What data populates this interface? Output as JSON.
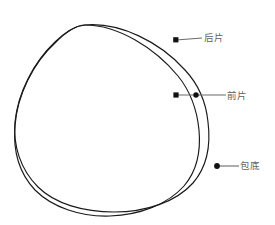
{
  "diagram": {
    "type": "technical-line-drawing",
    "canvas": {
      "width": 275,
      "height": 225,
      "background": "#ffffff"
    },
    "stroke_color": "#1a1a1a",
    "leader_color": "#6b6b6b",
    "label_color": "#5f5f5f",
    "shapes": [
      {
        "id": "outer-outline",
        "name": "后片轮廓",
        "description": "outer rounded-triangular silhouette",
        "path": "M 85 25 C 120 22 160 42 185 70 C 199 85 206 102 208 122 C 211 146 206 168 193 183 C 176 202 146 212 114 212 C 84 212 55 204 38 187 C 20 169 13 145 15 122 C 18 92 34 62 55 42 C 65 32 75 26 85 25 Z"
      },
      {
        "id": "inner-outline",
        "name": "前片轮廓",
        "description": "inner silhouette crossing the outer one",
        "path": "M 85 25 C 118 25 155 48 178 76 C 191 92 197 110 199 130 C 201 152 196 172 184 186 C 168 204 140 215 110 216 C 80 217 52 207 35 190 C 19 173 13 150 15 126 C 17 96 33 63 55 43 C 65 33 75 25 85 25 Z"
      }
    ],
    "annotations": [
      {
        "id": "back-panel",
        "label": "后片",
        "dot": {
          "x": 176,
          "y": 40
        },
        "line": {
          "x1": 176,
          "y1": 40,
          "x2": 202,
          "y2": 38
        }
      },
      {
        "id": "front-panel",
        "label": "前片",
        "dot": {
          "x": 176,
          "y": 95
        },
        "line": {
          "x1": 176,
          "y1": 95,
          "x2": 226,
          "y2": 95
        }
      },
      {
        "id": "bag-bottom",
        "label": "包底",
        "dot": {
          "x": 217,
          "y": 166
        },
        "line": {
          "x1": 217,
          "y1": 166,
          "x2": 239,
          "y2": 166
        }
      }
    ]
  }
}
